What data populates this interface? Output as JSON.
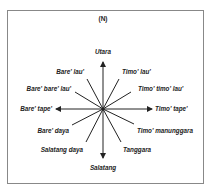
{
  "diagram": {
    "title": "(N)",
    "labels": {
      "north": "Utara",
      "north_east": "Timo' lau'",
      "east_north_east": "Timo' timo' lau'",
      "east": "Timo' tape'",
      "east_south_east": "Timo' manunggara",
      "south_east": "Tanggara",
      "south": "Salatang",
      "south_west": "Salatang daya",
      "west_south_west": "Bare' daya",
      "west": "Bare' tape'",
      "west_north_west": "Bare' bare' lau'",
      "north_west": "Bare' lau'"
    },
    "line_color": "#222222",
    "frame_color": "#888888"
  }
}
